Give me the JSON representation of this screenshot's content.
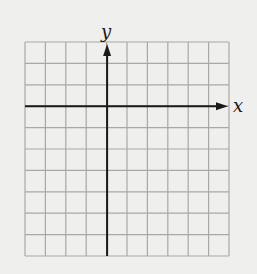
{
  "diagram": {
    "type": "cartesian-grid",
    "grid": {
      "columns": 10,
      "rows": 10,
      "line_color": "#a8a8a8",
      "background": "#efefed"
    },
    "axes": {
      "x_label": "x",
      "y_label": "y",
      "origin_column": 4,
      "origin_row": 3,
      "axis_color": "#1a1a1a",
      "x_arrow": "positive",
      "y_arrow": "positive"
    }
  }
}
